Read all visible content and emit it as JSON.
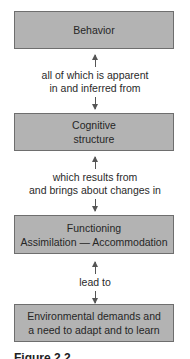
{
  "diagram": {
    "nodes": [
      {
        "id": "behavior",
        "lines": [
          "Behavior"
        ]
      },
      {
        "id": "cognitive-structure",
        "lines": [
          "Cognitive",
          "structure"
        ]
      },
      {
        "id": "functioning",
        "lines": [
          "Functioning",
          "Assimilation — Accommodation"
        ]
      },
      {
        "id": "environmental-demands",
        "lines": [
          "Environmental demands and",
          "a need to adapt and to learn"
        ]
      }
    ],
    "edges": [
      {
        "from": "behavior",
        "to": "cognitive-structure",
        "direction": "bidirectional",
        "lines": [
          "all of which is apparent",
          "in and inferred from"
        ]
      },
      {
        "from": "cognitive-structure",
        "to": "functioning",
        "direction": "bidirectional",
        "lines": [
          "which results from",
          "and brings about changes in"
        ]
      },
      {
        "from": "functioning",
        "to": "environmental-demands",
        "direction": "bidirectional",
        "lines": [
          "lead to"
        ]
      }
    ],
    "caption": "Figure 2.2"
  },
  "colors": {
    "box_fill": "#b3b3b3",
    "box_border": "#6e6e6e",
    "text": "#2a2a2a",
    "arrow": "#555555"
  }
}
